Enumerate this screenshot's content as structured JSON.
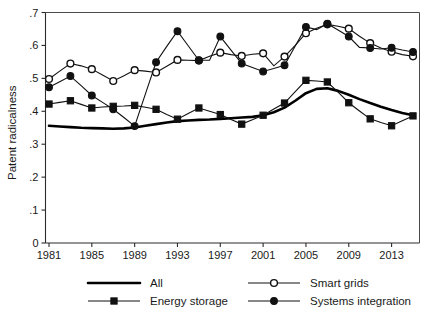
{
  "chart_data": {
    "type": "line",
    "title": "",
    "xlabel": "",
    "ylabel": "Patent radicalness",
    "xlim": [
      1981,
      2015
    ],
    "ylim": [
      0,
      0.7
    ],
    "grid": false,
    "legend_position": "bottom",
    "x": [
      1981,
      1982,
      1983,
      1984,
      1985,
      1986,
      1987,
      1988,
      1989,
      1990,
      1991,
      1992,
      1993,
      1994,
      1995,
      1996,
      1997,
      1998,
      1999,
      2000,
      2001,
      2002,
      2003,
      2004,
      2005,
      2006,
      2007,
      2008,
      2009,
      2010,
      2011,
      2012,
      2013,
      2014,
      2015
    ],
    "xtick_labels": [
      "1981",
      "1985",
      "1989",
      "1993",
      "1997",
      "2001",
      "2005",
      "2009",
      "2013"
    ],
    "xtick_values": [
      1981,
      1985,
      1989,
      1993,
      1997,
      2001,
      2005,
      2009,
      2013
    ],
    "ytick_labels": [
      "0",
      ".1",
      ".2",
      ".3",
      ".4",
      ".5",
      ".6",
      ".7"
    ],
    "ytick_values": [
      0,
      0.1,
      0.2,
      0.3,
      0.4,
      0.5,
      0.6,
      0.7
    ],
    "series": [
      {
        "name": "All",
        "marker": "none",
        "line": "thick",
        "values": [
          0.356,
          0.354,
          0.352,
          0.35,
          0.349,
          0.348,
          0.347,
          0.348,
          0.351,
          0.356,
          0.361,
          0.366,
          0.37,
          0.372,
          0.374,
          0.375,
          0.377,
          0.379,
          0.381,
          0.383,
          0.388,
          0.397,
          0.411,
          0.432,
          0.455,
          0.468,
          0.47,
          0.462,
          0.45,
          0.437,
          0.425,
          0.414,
          0.404,
          0.395,
          0.388
        ]
      },
      {
        "name": "Smart grids",
        "marker": "open-circle",
        "line": "thin",
        "values": [
          0.498,
          0.522,
          0.545,
          0.538,
          0.528,
          0.51,
          0.492,
          0.508,
          0.525,
          0.522,
          0.518,
          0.537,
          0.556,
          0.555,
          0.554,
          0.567,
          0.578,
          0.572,
          0.568,
          0.573,
          0.576,
          0.538,
          0.566,
          0.6,
          0.637,
          0.652,
          0.664,
          0.658,
          0.651,
          0.628,
          0.607,
          0.592,
          0.581,
          0.572,
          0.567
        ]
      },
      {
        "name": "Energy storage",
        "marker": "filled-square",
        "line": "thin",
        "values": [
          0.422,
          0.427,
          0.432,
          0.421,
          0.41,
          0.413,
          0.415,
          0.416,
          0.418,
          0.412,
          0.406,
          0.39,
          0.376,
          0.393,
          0.41,
          0.4,
          0.39,
          0.375,
          0.361,
          0.374,
          0.388,
          0.407,
          0.425,
          0.46,
          0.494,
          0.492,
          0.489,
          0.458,
          0.426,
          0.401,
          0.377,
          0.366,
          0.356,
          0.371,
          0.386
        ]
      },
      {
        "name": "Systems integration",
        "marker": "filled-circle",
        "line": "thin",
        "values": [
          0.473,
          0.49,
          0.507,
          0.478,
          0.448,
          0.427,
          0.406,
          0.381,
          0.355,
          0.452,
          0.549,
          0.597,
          0.643,
          0.599,
          0.555,
          0.555,
          0.627,
          0.586,
          0.545,
          0.533,
          0.521,
          0.53,
          0.54,
          0.598,
          0.656,
          0.648,
          0.666,
          0.647,
          0.627,
          0.594,
          0.592,
          0.589,
          0.593,
          0.586,
          0.58
        ]
      }
    ]
  },
  "axis": {
    "y_title": "Patent radicalness"
  },
  "legend": {
    "entries": [
      {
        "label": "All",
        "style": "thick-line"
      },
      {
        "label": "Smart grids",
        "style": "open-circle"
      },
      {
        "label": "Energy storage",
        "style": "filled-square"
      },
      {
        "label": "Systems integration",
        "style": "filled-circle"
      }
    ]
  },
  "colors": {
    "series_stroke": "#111111",
    "axis": "#2b2b2b",
    "background": "#ffffff",
    "marker_fill_open": "#ffffff",
    "marker_fill_solid": "#111111"
  }
}
